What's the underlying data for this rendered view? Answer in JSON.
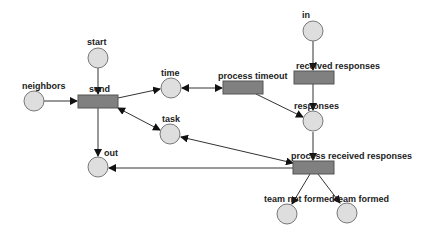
{
  "diagram": {
    "type": "petri-net",
    "colors": {
      "place_fill": "#dedede",
      "transition_fill": "#808080",
      "arc": "#333333",
      "background": "#ffffff"
    },
    "places": [
      {
        "id": "start",
        "label": "start",
        "cx": 98,
        "cy": 58
      },
      {
        "id": "neighbors",
        "label": "neighbors",
        "cx": 34,
        "cy": 101
      },
      {
        "id": "time",
        "label": "time",
        "cx": 171,
        "cy": 88
      },
      {
        "id": "task",
        "label": "task",
        "cx": 170,
        "cy": 134
      },
      {
        "id": "out",
        "label": "out",
        "cx": 98,
        "cy": 167
      },
      {
        "id": "in",
        "label": "in",
        "cx": 313,
        "cy": 31
      },
      {
        "id": "responses",
        "label": "responses",
        "cx": 313,
        "cy": 121
      },
      {
        "id": "team_not_formed",
        "label": "team not formed",
        "cx": 287,
        "cy": 214
      },
      {
        "id": "team_formed",
        "label": "team formed",
        "cx": 347,
        "cy": 213
      }
    ],
    "transitions": [
      {
        "id": "send",
        "label": "send",
        "x": 78,
        "y": 95,
        "w": 40,
        "h": 13
      },
      {
        "id": "process_timeout",
        "label": "process timeout",
        "x": 223,
        "y": 81,
        "w": 40,
        "h": 13
      },
      {
        "id": "received_responses",
        "label": "received responses",
        "x": 294,
        "y": 71,
        "w": 40,
        "h": 13
      },
      {
        "id": "process_received_responses",
        "label": "process received responses",
        "x": 293,
        "y": 161,
        "w": 41,
        "h": 13
      }
    ],
    "arcs": [
      {
        "from": "start",
        "to": "send"
      },
      {
        "from": "neighbors",
        "to": "send"
      },
      {
        "from": "send",
        "to": "time"
      },
      {
        "from": "time",
        "to": "process_timeout",
        "bidirectional": true
      },
      {
        "from": "send",
        "to": "task",
        "bidirectional": true
      },
      {
        "from": "send",
        "to": "out"
      },
      {
        "from": "process_timeout",
        "to": "responses"
      },
      {
        "from": "in",
        "to": "received_responses"
      },
      {
        "from": "received_responses",
        "to": "responses"
      },
      {
        "from": "responses",
        "to": "process_received_responses"
      },
      {
        "from": "process_received_responses",
        "to": "task"
      },
      {
        "from": "process_received_responses",
        "to": "out"
      },
      {
        "from": "process_received_responses",
        "to": "team_not_formed"
      },
      {
        "from": "process_received_responses",
        "to": "team_formed"
      }
    ]
  }
}
